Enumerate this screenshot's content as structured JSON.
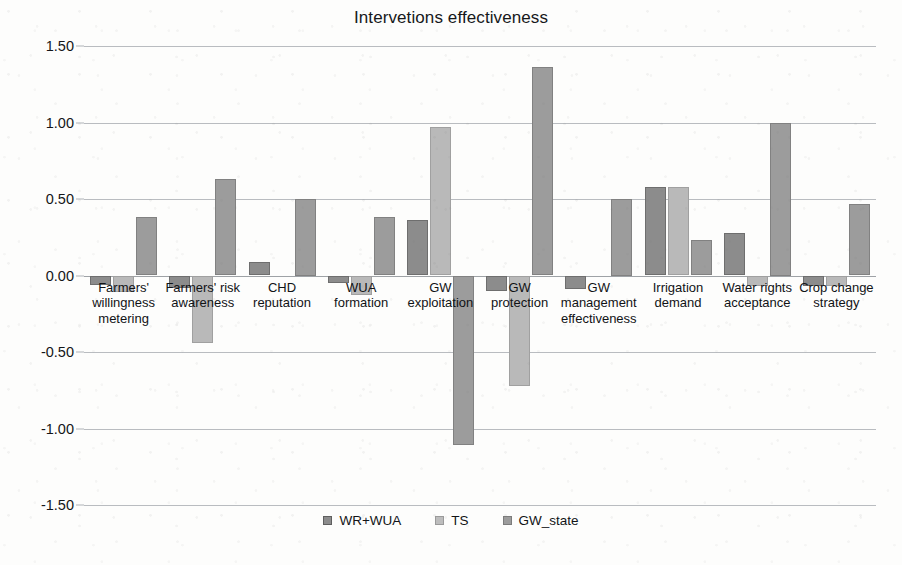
{
  "chart_data": {
    "type": "bar",
    "title": "Intervetions effectiveness",
    "xlabel": "",
    "ylabel": "",
    "ylim": [
      -1.5,
      1.5
    ],
    "yticks": [
      "1.50",
      "1.00",
      "0.50",
      "0.00",
      "-0.50",
      "-1.00",
      "-1.50"
    ],
    "ytick_values": [
      1.5,
      1.0,
      0.5,
      0.0,
      -0.5,
      -1.0,
      -1.5
    ],
    "grid": true,
    "legend_position": "bottom",
    "categories": [
      "Farmers' willingness metering",
      "Farmers' risk awareness",
      "CHD reputation",
      "WUA formation",
      "GW exploitation",
      "GW protection",
      "GW management effectiveness",
      "Irrigation demand",
      "Water rights acceptance",
      "Crop change strategy"
    ],
    "category_lines": [
      [
        "Farmers'",
        "willingness",
        "metering"
      ],
      [
        "Farmers' risk",
        "awareness"
      ],
      [
        "CHD",
        "reputation"
      ],
      [
        "WUA",
        "formation"
      ],
      [
        "GW",
        "exploitation"
      ],
      [
        "GW",
        "protection"
      ],
      [
        "GW",
        "management",
        "effectiveness"
      ],
      [
        "Irrigation",
        "demand"
      ],
      [
        "Water rights",
        "acceptance"
      ],
      [
        "Crop change",
        "strategy"
      ]
    ],
    "series": [
      {
        "name": "WR+WUA",
        "color": "#8c8c8c",
        "values": [
          -0.06,
          -0.08,
          0.09,
          -0.05,
          0.36,
          -0.1,
          -0.09,
          0.58,
          0.28,
          -0.07
        ]
      },
      {
        "name": "TS",
        "color": "#b9b9b9",
        "values": [
          -0.11,
          -0.44,
          0.0,
          -0.13,
          0.97,
          -0.72,
          0.0,
          0.58,
          -0.07,
          -0.07
        ]
      },
      {
        "name": "GW_state",
        "color": "#9c9c9c",
        "values": [
          0.38,
          0.63,
          0.5,
          0.38,
          -1.11,
          1.36,
          0.5,
          0.23,
          1.0,
          0.47
        ]
      }
    ]
  },
  "legend": {
    "items": [
      {
        "label": "WR+WUA"
      },
      {
        "label": "TS"
      },
      {
        "label": "GW_state"
      }
    ]
  }
}
